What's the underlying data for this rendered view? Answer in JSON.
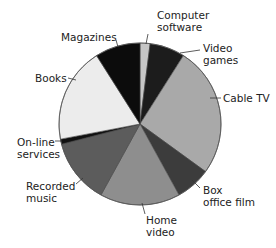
{
  "chart_data": {
    "type": "pie",
    "title": "",
    "start_angle_deg": 0,
    "direction": "clockwise",
    "legend": "none (direct labels with leader lines)",
    "slices": [
      {
        "label": "Computer software",
        "value": 2,
        "color": "#c6c6c6"
      },
      {
        "label": "Video games",
        "value": 7,
        "color": "#1c1c1c"
      },
      {
        "label": "Cable TV",
        "value": 26,
        "color": "#a9a9a9"
      },
      {
        "label": "Box office film",
        "value": 7,
        "color": "#3c3c3c"
      },
      {
        "label": "Home video",
        "value": 16,
        "color": "#8e8e8e"
      },
      {
        "label": "Recorded music",
        "value": 13,
        "color": "#5c5c5c"
      },
      {
        "label": "On-line services",
        "value": 1,
        "color": "#111111"
      },
      {
        "label": "Books",
        "value": 19,
        "color": "#ececec"
      },
      {
        "label": "Magazines",
        "value": 9,
        "color": "#0c0c0c"
      }
    ]
  },
  "labels": {
    "computer_software": [
      "Computer",
      "software"
    ],
    "video_games": [
      "Video",
      "games"
    ],
    "cable_tv": [
      "Cable TV"
    ],
    "box_office_film": [
      "Box",
      "office film"
    ],
    "home_video": [
      "Home",
      "video"
    ],
    "recorded_music": [
      "Recorded",
      "music"
    ],
    "online_services": [
      "On-line",
      "services"
    ],
    "books": [
      "Books"
    ],
    "magazines": [
      "Magazines"
    ]
  }
}
